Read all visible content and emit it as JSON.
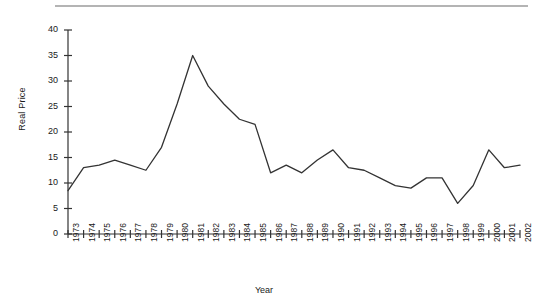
{
  "axes": {
    "ylabel": "Real Price",
    "xlabel": "Year"
  },
  "chart_data": {
    "type": "line",
    "title": "",
    "subtitle": "",
    "xlabel": "Year",
    "ylabel": "Real Price",
    "xlim": [
      1973,
      2002
    ],
    "ylim": [
      0,
      40
    ],
    "yticks": [
      0,
      5,
      10,
      15,
      20,
      25,
      30,
      35,
      40
    ],
    "grid": false,
    "legend": null,
    "legend_position": "none",
    "line_color": "#333333",
    "categories": [
      "1973",
      "1974",
      "1975",
      "1976",
      "1977",
      "1978",
      "1979",
      "1980",
      "1981",
      "1982",
      "1983",
      "1984",
      "1985",
      "1986",
      "1987",
      "1988",
      "1989",
      "1990",
      "1991",
      "1992",
      "1993",
      "1994",
      "1995",
      "1996",
      "1997",
      "1998",
      "1999",
      "2000",
      "2001",
      "2002"
    ],
    "values": [
      8.5,
      13.0,
      13.5,
      14.5,
      13.5,
      12.5,
      17.0,
      25.5,
      35.0,
      29.0,
      25.5,
      22.5,
      21.5,
      12.0,
      13.5,
      12.0,
      14.5,
      16.5,
      13.0,
      12.5,
      11.0,
      9.5,
      9.0,
      11.0,
      11.0,
      6.0,
      9.5,
      16.5,
      13.0,
      13.5
    ],
    "series": [
      {
        "name": "Real Price",
        "values": [
          8.5,
          13.0,
          13.5,
          14.5,
          13.5,
          12.5,
          17.0,
          25.5,
          35.0,
          29.0,
          25.5,
          22.5,
          21.5,
          12.0,
          13.5,
          12.0,
          14.5,
          16.5,
          13.0,
          12.5,
          11.0,
          9.5,
          9.0,
          11.0,
          11.0,
          6.0,
          9.5,
          16.5,
          13.0,
          13.5
        ]
      }
    ]
  }
}
